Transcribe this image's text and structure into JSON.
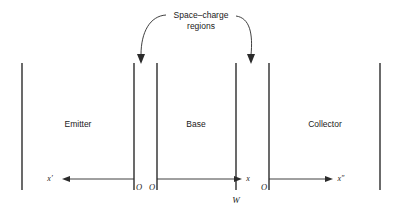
{
  "diagram": {
    "colors": {
      "line": "#2b2b2b",
      "text": "#1a1a1a",
      "background": "#ffffff"
    },
    "annotation": {
      "line1": "Space–charge",
      "line2": "regions"
    },
    "regions": [
      {
        "id": "emitter",
        "label": "Emitter",
        "cx": 78,
        "cy": 124
      },
      {
        "id": "base",
        "label": "Base",
        "cx": 196,
        "cy": 124
      },
      {
        "id": "collector",
        "label": "Collector",
        "cx": 325,
        "cy": 124
      }
    ],
    "boundaries": [
      {
        "id": "emitter-outer-contact",
        "x": 22,
        "y1": 63,
        "y2": 190
      },
      {
        "id": "emitter-depletion-left",
        "x": 134,
        "y1": 63,
        "y2": 190
      },
      {
        "id": "base-depletion-left",
        "x": 157,
        "y1": 63,
        "y2": 190
      },
      {
        "id": "base-depletion-right",
        "x": 236,
        "y1": 63,
        "y2": 190
      },
      {
        "id": "collector-depletion-right",
        "x": 269,
        "y1": 63,
        "y2": 190
      },
      {
        "id": "collector-outer-contact",
        "x": 380,
        "y1": 63,
        "y2": 190
      }
    ],
    "axes": [
      {
        "id": "x-prime",
        "label": "x′",
        "label_x": 50,
        "label_y": 181,
        "direction": "left",
        "y": 179,
        "start_x": 134,
        "end_x": 63
      },
      {
        "id": "x",
        "label": "x",
        "label_x": 248,
        "label_y": 181,
        "direction": "right",
        "y": 179,
        "start_x": 157,
        "end_x": 241
      },
      {
        "id": "x-double-prime",
        "label": "x″",
        "label_x": 340,
        "label_y": 181,
        "direction": "right",
        "y": 179,
        "start_x": 269,
        "end_x": 332
      }
    ],
    "origins": [
      {
        "id": "origin-x-prime",
        "label": "O",
        "x": 139,
        "y": 189
      },
      {
        "id": "origin-x",
        "label": "O",
        "x": 152,
        "y": 189
      },
      {
        "id": "origin-x-double-prime",
        "label": "O",
        "x": 265,
        "y": 189
      }
    ],
    "markers": [
      {
        "id": "base-width",
        "label": "W",
        "x": 236,
        "y": 202
      }
    ],
    "leaders": [
      {
        "id": "leader-left",
        "path": "M 166 15 C 150 16 141 32 141 56",
        "arrow": {
          "x": 141,
          "y": 64,
          "dir": "down"
        }
      },
      {
        "id": "leader-right",
        "path": "M 236 16 C 250 18 253 34 251 56",
        "arrow": {
          "x": 251,
          "y": 64,
          "dir": "down"
        }
      }
    ],
    "annotation_text_pos": {
      "line1_x": 201,
      "line1_y": 15,
      "line2_x": 201,
      "line2_y": 26
    }
  }
}
